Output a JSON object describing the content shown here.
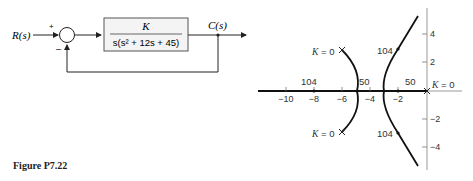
{
  "block_diagram": {
    "input_label": "R(s)",
    "output_label": "C(s)",
    "sum_plus": "+",
    "sum_minus": "–",
    "numerator": "K",
    "denominator": "s(s² + 12s + 45)"
  },
  "root_locus": {
    "x_ticks": [
      "−10",
      "−8",
      "−6",
      "−4",
      "−2"
    ],
    "y_ticks": [
      "4",
      "2",
      "−2",
      "−4"
    ],
    "labels": {
      "k0_origin": "K = 0",
      "k0_upper": "K = 0",
      "k0_lower": "K = 0",
      "k104_real": "104",
      "k50_left": "50",
      "k50_right": "50",
      "k104_upper": "104",
      "k104_lower": "104"
    }
  },
  "caption": "Figure P7.22"
}
